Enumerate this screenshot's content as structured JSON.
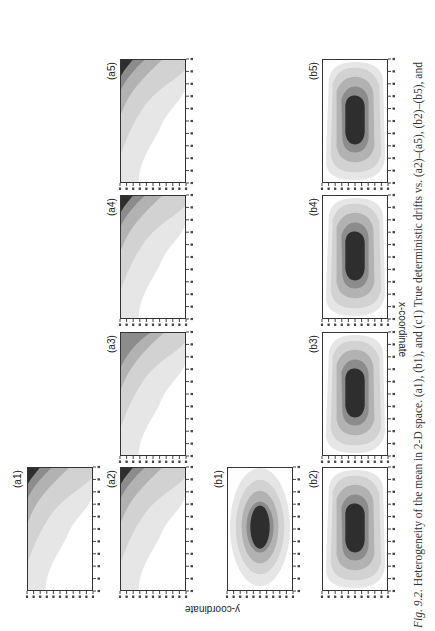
{
  "figure": {
    "caption_prefix": "Fig. 9.2.",
    "caption_text": " Heterogeneity of the mean in 2-D space. (a1), (b1), and (c1) True deterministic drifts vs. (a2)–(a5), (b2)–(b5), and",
    "x_axis_title": "x-coordinate",
    "y_axis_title": "y-coordinate",
    "colors": {
      "level1": "#e6e6e6",
      "level2": "#d2d2d2",
      "level3": "#b2b2b2",
      "level4": "#8c8c8c",
      "level5": "#2e2e2e",
      "background": "#ffffff"
    },
    "panels": [
      {
        "id": "a1",
        "label": "(a1)",
        "type": "corner-gradient"
      },
      {
        "id": "a2",
        "label": "(a2)",
        "type": "corner-gradient"
      },
      {
        "id": "a3",
        "label": "(a3)",
        "type": "corner-gradient"
      },
      {
        "id": "a4",
        "label": "(a4)",
        "type": "corner-gradient"
      },
      {
        "id": "a5",
        "label": "(a5)",
        "type": "corner-gradient"
      },
      {
        "id": "b1",
        "label": "(b1)",
        "type": "elliptical-peak"
      },
      {
        "id": "b2",
        "label": "(b2)",
        "type": "elliptical-peak"
      },
      {
        "id": "b3",
        "label": "(b3)",
        "type": "elliptical-peak"
      },
      {
        "id": "b4",
        "label": "(b4)",
        "type": "elliptical-peak"
      },
      {
        "id": "b5",
        "label": "(b5)",
        "type": "elliptical-peak"
      }
    ]
  },
  "chart_data": {
    "type": "heatmap",
    "title": "Heterogeneity of the mean in 2-D space",
    "xlabel": "x-coordinate",
    "ylabel": "y-coordinate",
    "orientation": "figure rotated 90° counter-clockwise on page",
    "grid": false,
    "ticks_per_axis": 11,
    "panels": [
      {
        "label": "(a1)",
        "description": "true deterministic drift; monotone increase toward one corner",
        "levels": 5
      },
      {
        "label": "(a2)",
        "description": "estimated drift, near-identical to (a1)",
        "levels": 5
      },
      {
        "label": "(a3)",
        "description": "estimated drift; darkest level absent",
        "levels": 4
      },
      {
        "label": "(a4)",
        "description": "estimated drift, corner gradient",
        "levels": 5
      },
      {
        "label": "(a5)",
        "description": "estimated drift, corner gradient",
        "levels": 5
      },
      {
        "label": "(b1)",
        "description": "true deterministic drift; smooth elliptical peak centered",
        "levels": 5
      },
      {
        "label": "(b2)",
        "description": "estimated drift, elliptical peak",
        "levels": 5
      },
      {
        "label": "(b3)",
        "description": "estimated drift, elliptical peak with irregular outer contours",
        "levels": 5
      },
      {
        "label": "(b4)",
        "description": "estimated drift, elliptical peak with irregular outer contours",
        "levels": 5
      },
      {
        "label": "(b5)",
        "description": "estimated drift, elliptical peak with irregular outer contours",
        "levels": 5
      }
    ]
  }
}
